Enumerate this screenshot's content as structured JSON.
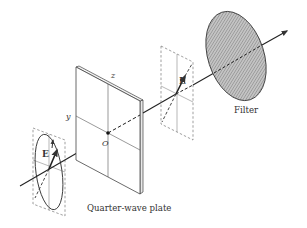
{
  "diagram": {
    "type": "optics-schematic",
    "colors": {
      "stroke": "#333333",
      "frame_dashed": "#666666",
      "plate_face": "#ffffff",
      "plate_edge": "#e6e6e6",
      "filter_fill": "#b8b8b8",
      "filter_hatch": "#7a7a7a"
    },
    "labels": {
      "plate_caption": "Quarter-wave plate",
      "filter_caption": "Filter",
      "axis_z": "z",
      "axis_y": "y",
      "origin": "O",
      "field_input": "E",
      "field_output": "E"
    },
    "elements": [
      {
        "id": "input-polarization-frame",
        "description": "Dashed frame with elliptical polarization and field vector E"
      },
      {
        "id": "quarter-wave-plate",
        "description": "Thin rectangular plate with y and z axes crossing at origin O"
      },
      {
        "id": "output-polarization-frame",
        "description": "Dashed frame with linear polarization vector E"
      },
      {
        "id": "filter",
        "description": "Hatched elliptical filter disk"
      },
      {
        "id": "beam-axis",
        "description": "Propagation axis arrow through all elements"
      }
    ]
  }
}
